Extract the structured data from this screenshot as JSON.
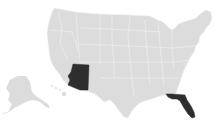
{
  "map": {
    "title": "United States map",
    "colors": {
      "background": "#ffffff",
      "default_state": "#dcdcdc",
      "highlight_state": "#2e2e2e",
      "border": "#f2f2f2"
    },
    "highlighted_states": [
      {
        "name": "Arizona",
        "abbr": "AZ"
      },
      {
        "name": "Florida",
        "abbr": "FL"
      }
    ],
    "insets": [
      "Alaska",
      "Hawaii"
    ]
  }
}
